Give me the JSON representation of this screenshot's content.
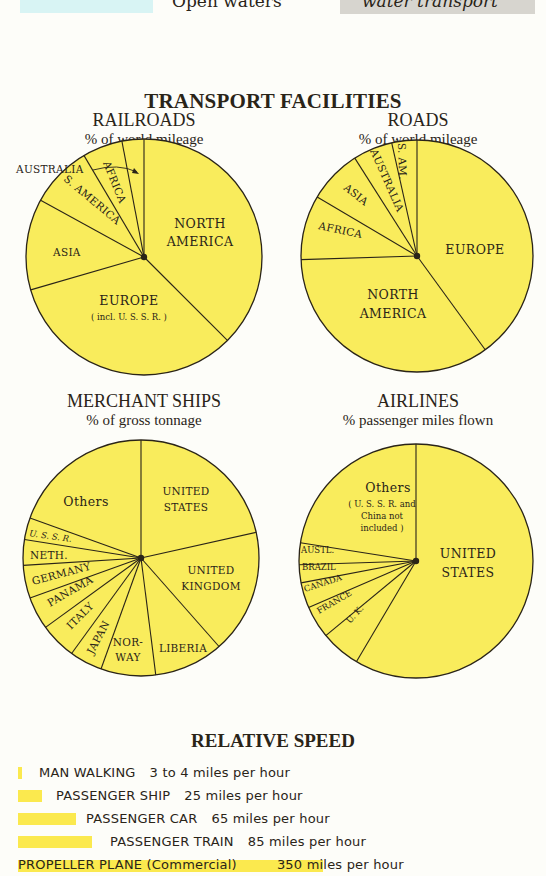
{
  "legend_strip": {
    "open_waters_label": "Open waters",
    "water_transport_label": "water transport",
    "colors": {
      "open_waters": "#d8f4f4",
      "water_transport": "#d7d5cf"
    }
  },
  "main_title": "TRANSPORT FACILITIES",
  "colors": {
    "pie_fill": "#f9ec5c",
    "pie_stroke": "#2a2418",
    "speed_bar": "#fbe94e",
    "background": "#fdfdf9"
  },
  "charts": {
    "railroads": {
      "title": "RAILROADS",
      "subtitle": "% of world mileage"
    },
    "roads": {
      "title": "ROADS",
      "subtitle": "% of world mileage"
    },
    "merchant_ships": {
      "title": "MERCHANT SHIPS",
      "subtitle": "% of gross tonnage"
    },
    "airlines": {
      "title": "AIRLINES",
      "subtitle": "% passenger miles flown"
    }
  },
  "labels": {
    "railroads": {
      "australia": "AUSTRALIA",
      "africa": "AFRICA",
      "s_america": "S. AMERICA",
      "asia": "ASIA",
      "north_america_1": "NORTH",
      "north_america_2": "AMERICA",
      "europe": "EUROPE",
      "europe_note": "( incl. U. S. S. R. )"
    },
    "roads": {
      "s_am": "S. AM.",
      "australia": "AUSTRALIA",
      "asia": "ASIA",
      "africa": "AFRICA",
      "europe": "EUROPE",
      "north_america_1": "NORTH",
      "north_america_2": "AMERICA"
    },
    "merchant_ships": {
      "others": "Others",
      "us_1": "UNITED",
      "us_2": "STATES",
      "uk_1": "UNITED",
      "uk_2": "KINGDOM",
      "liberia": "LIBERIA",
      "norway_1": "NOR-",
      "norway_2": "WAY",
      "japan": "JAPAN",
      "italy": "ITALY",
      "panama": "PANAMA",
      "germany": "GERMANY",
      "neth": "NETH.",
      "ussr": "U. S. S. R."
    },
    "airlines": {
      "others": "Others",
      "others_note_1": "( U. S. S. R. and",
      "others_note_2": "China not",
      "others_note_3": "included )",
      "us_1": "UNITED",
      "us_2": "STATES",
      "uk": "U. K.",
      "france": "FRANCE",
      "canada": "CANADA",
      "brazil": "BRAZIL",
      "austl": "AUSTL."
    }
  },
  "chart_data": [
    {
      "type": "pie",
      "title": "RAILROADS",
      "subtitle": "% of world mileage",
      "categories": [
        "NORTH AMERICA",
        "EUROPE (incl. U.S.S.R.)",
        "ASIA",
        "S. AMERICA",
        "AFRICA",
        "AUSTRALIA"
      ],
      "values": [
        37.5,
        33,
        12.5,
        8.5,
        5.5,
        3
      ],
      "start": "12 o'clock, clockwise"
    },
    {
      "type": "pie",
      "title": "ROADS",
      "subtitle": "% of world mileage",
      "categories": [
        "EUROPE",
        "NORTH AMERICA",
        "AFRICA",
        "ASIA",
        "AUSTRALIA",
        "S. AM."
      ],
      "values": [
        40,
        34.5,
        9,
        7.5,
        5.5,
        3.5
      ],
      "start": "12 o'clock, clockwise"
    },
    {
      "type": "pie",
      "title": "MERCHANT SHIPS",
      "subtitle": "% of gross tonnage",
      "categories": [
        "UNITED STATES",
        "UNITED KINGDOM",
        "LIBERIA",
        "NORWAY",
        "JAPAN",
        "ITALY",
        "PANAMA",
        "GERMANY",
        "NETH.",
        "U.S.S.R.",
        "Others"
      ],
      "values": [
        21.5,
        17,
        9.5,
        7.5,
        4.5,
        5,
        4.5,
        4.5,
        3.5,
        3,
        19.5
      ],
      "start": "12 o'clock, clockwise"
    },
    {
      "type": "pie",
      "title": "AIRLINES",
      "subtitle": "% passenger miles flown",
      "categories": [
        "UNITED STATES",
        "U.K.",
        "FRANCE",
        "CANADA",
        "BRAZIL",
        "AUSTL.",
        "Others (U.S.S.R. and China not included)"
      ],
      "values": [
        58.5,
        5.5,
        4.5,
        3.5,
        2.5,
        3,
        22.5
      ],
      "start": "12 o'clock, clockwise"
    },
    {
      "type": "bar",
      "title": "RELATIVE SPEED",
      "orientation": "horizontal",
      "categories": [
        "MAN WALKING",
        "PASSENGER SHIP",
        "PASSENGER CAR",
        "PASSENGER TRAIN",
        "PROPELLER PLANE (Commercial)"
      ],
      "values": [
        3.5,
        25,
        65,
        85,
        350
      ],
      "unit": "miles per hour"
    }
  ],
  "speed": {
    "title": "RELATIVE SPEED",
    "rows": [
      {
        "label": "MAN WALKING",
        "value": "3 to 4 miles per hour",
        "bar_px": 4
      },
      {
        "label": "PASSENGER SHIP",
        "value": "25 miles per hour",
        "bar_px": 24
      },
      {
        "label": "PASSENGER CAR",
        "value": "65 miles per hour",
        "bar_px": 58
      },
      {
        "label": "PASSENGER TRAIN",
        "value": "85 miles per hour",
        "bar_px": 74
      },
      {
        "label": "PROPELLER PLANE (Commercial)",
        "value": "350",
        "unit": "miles per hour",
        "bar_px": 305
      }
    ]
  }
}
